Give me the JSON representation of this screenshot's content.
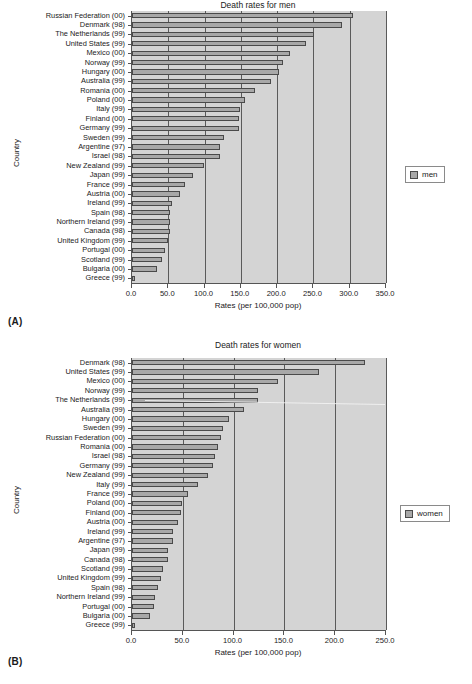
{
  "figure": {
    "panel_a_tag": "(A)",
    "panel_b_tag": "(B)"
  },
  "chart_data": [
    {
      "id": "men",
      "type": "bar",
      "orientation": "horizontal",
      "title": "Death rates for men",
      "xlabel": "Rates (per 100,000 pop)",
      "ylabel": "Country",
      "legend": [
        "men"
      ],
      "legend_position": "right",
      "grid": true,
      "xlim": [
        0.0,
        350.0
      ],
      "xticks": [
        0.0,
        50.0,
        100.0,
        150.0,
        200.0,
        250.0,
        300.0,
        350.0
      ],
      "xticklabels": [
        "0.0",
        "50.0",
        "100.0",
        "150.0",
        "200.0",
        "250.0",
        "300.0",
        "350.0"
      ],
      "categories": [
        "Russian Federation (00)",
        "Denmark (98)",
        "The Netherlands (99)",
        "United States (99)",
        "Mexico (00)",
        "Norway (99)",
        "Hungary (00)",
        "Australia (99)",
        "Romania (00)",
        "Poland (00)",
        "Italy (99)",
        "Finland (00)",
        "Germany (99)",
        "Sweden (99)",
        "Argentine (97)",
        "Israel (98)",
        "New Zealand (99)",
        "Japan (99)",
        "France (99)",
        "Austria (00)",
        "Ireland (99)",
        "Spain (98)",
        "Northern Ireland (99)",
        "Canada (98)",
        "United Kingdom (99)",
        "Portugal (00)",
        "Scotland (99)",
        "Bulgaria (00)",
        "Greece (99)"
      ],
      "values": [
        305.0,
        289.0,
        251.0,
        240.0,
        218.0,
        208.0,
        202.0,
        192.0,
        169.0,
        156.0,
        149.0,
        148.0,
        148.0,
        127.0,
        121.0,
        121.0,
        99.0,
        84.0,
        73.0,
        66.0,
        55.0,
        52.0,
        52.0,
        52.0,
        49.0,
        46.0,
        41.0,
        34.0,
        4.0
      ]
    },
    {
      "id": "women",
      "type": "bar",
      "orientation": "horizontal",
      "title": "Death rates for women",
      "xlabel": "Rates (per 100,000 pop)",
      "ylabel": "Country",
      "legend": [
        "women"
      ],
      "legend_position": "right",
      "grid": true,
      "xlim": [
        0.0,
        250.0
      ],
      "xticks": [
        0.0,
        50.0,
        100.0,
        150.0,
        200.0,
        250.0
      ],
      "xticklabels": [
        "0.0",
        "50.0",
        "100.0",
        "150.0",
        "200.0",
        "250.0"
      ],
      "categories": [
        "Denmark (98)",
        "United States (99)",
        "Mexico (00)",
        "Norway (99)",
        "The Netherlands (99)",
        "Australia (99)",
        "Hungary (00)",
        "Sweden (99)",
        "Russian Federation (00)",
        "Romania (00)",
        "Israel (98)",
        "Germany (99)",
        "New Zealand (99)",
        "Italy (99)",
        "France (99)",
        "Poland (00)",
        "Finland (00)",
        "Austria (00)",
        "Ireland (99)",
        "Argentine (97)",
        "Japan (99)",
        "Canada (98)",
        "Scotland (99)",
        "United Kingdom (99)",
        "Spain (98)",
        "Northern Ireland (99)",
        "Portugal (00)",
        "Bulgaria (00)",
        "Greece (99)"
      ],
      "values": [
        229.0,
        184.0,
        144.0,
        124.0,
        124.0,
        110.0,
        95.0,
        90.0,
        88.0,
        85.0,
        82.0,
        80.0,
        75.0,
        65.0,
        55.0,
        49.0,
        48.0,
        45.0,
        40.0,
        40.0,
        35.0,
        35.0,
        31.0,
        29.0,
        26.0,
        23.0,
        22.0,
        18.0,
        3.0
      ]
    }
  ]
}
